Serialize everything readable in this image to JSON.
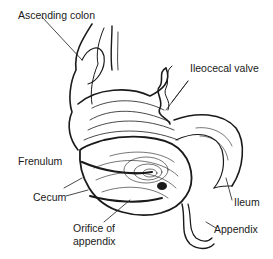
{
  "diagram": {
    "labels": {
      "ascending_colon": "Ascending colon",
      "ileocecal_valve": "Ileocecal valve",
      "frenulum": "Frenulum",
      "cecum": "Cecum",
      "orifice_line1": "Orifice of",
      "orifice_line2": "appendix",
      "ileum": "Ileum",
      "appendix": "Appendix"
    },
    "colors": {
      "ink": "#1a1a1a",
      "background": "#ffffff"
    }
  }
}
